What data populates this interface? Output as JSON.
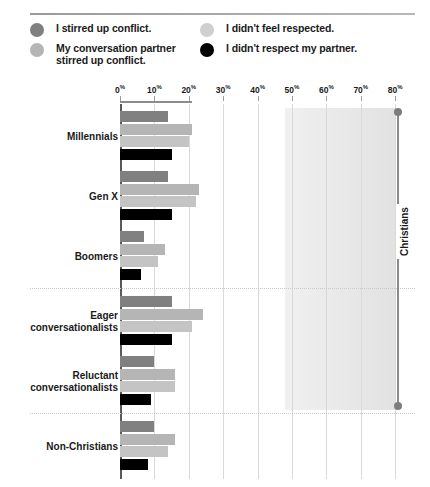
{
  "legend": {
    "columns": [
      {
        "items": [
          {
            "label": "I stirred up conflict.",
            "color": "#808080",
            "icon": "circle-swatch-icon"
          },
          {
            "label": "My conversation partner stirred up conflict.",
            "color": "#b5b5b5",
            "icon": "circle-swatch-icon"
          }
        ]
      },
      {
        "items": [
          {
            "label": "I didn't feel respected.",
            "color": "#cfcfcf",
            "icon": "circle-swatch-icon"
          },
          {
            "label": "I didn't respect my partner.",
            "color": "#000000",
            "icon": "circle-swatch-icon"
          }
        ]
      }
    ]
  },
  "annotation": {
    "bracket_label": "Christians",
    "highlight_from": 48,
    "highlight_to": 80
  },
  "chart_data": {
    "type": "bar",
    "orientation": "horizontal",
    "title": "",
    "xlabel": "",
    "ylabel": "",
    "xlim": [
      0,
      80
    ],
    "grid": true,
    "legend_position": "top",
    "tick_labels": [
      "0%",
      "10%",
      "20%",
      "30%",
      "40%",
      "50%",
      "60%",
      "70%",
      "80%"
    ],
    "tick_values": [
      0,
      10,
      20,
      30,
      40,
      50,
      60,
      70,
      80
    ],
    "categories": [
      "Millennials",
      "Gen X",
      "Boomers",
      "Eager conversationalists",
      "Reluctant conversationalists",
      "Non-Christians"
    ],
    "series": [
      {
        "name": "I stirred up conflict.",
        "color": "#808080",
        "values": [
          14,
          14,
          7,
          15,
          10,
          10
        ]
      },
      {
        "name": "My conversation partner stirred up conflict.",
        "color": "#b5b5b5",
        "values": [
          21,
          23,
          13,
          24,
          16,
          16
        ]
      },
      {
        "name": "I didn't feel respected.",
        "color": "#c4c4c4",
        "values": [
          20,
          22,
          11,
          21,
          16,
          14
        ]
      },
      {
        "name": "I didn't respect my partner.",
        "color": "#000000",
        "values": [
          15,
          15,
          6,
          15,
          9,
          8
        ]
      }
    ],
    "group_separators_after": [
      "Boomers",
      "Reluctant conversationalists"
    ]
  }
}
